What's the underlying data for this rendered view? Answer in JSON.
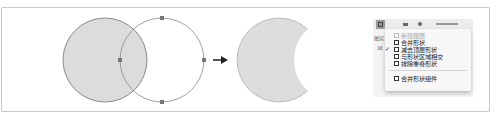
{
  "colors": {
    "shape_fill": "#dcdcdc",
    "shape_stroke": "#8a8a8a",
    "anchor": "#777777",
    "arrow": "#222222",
    "frame_border": "#c8c8c8"
  },
  "diagram": {
    "before": {
      "bottom_circle": {
        "cx": 105,
        "cy": 60,
        "r": 42,
        "filled": true
      },
      "top_circle": {
        "cx": 162,
        "cy": 60,
        "r": 42,
        "filled": false,
        "anchors": [
          [
            162,
            18
          ],
          [
            204,
            60
          ],
          [
            162,
            102
          ],
          [
            120,
            60
          ]
        ]
      }
    },
    "arrow_icon": "right-arrow",
    "after": {
      "result_shape": "crescent",
      "operation": "subtract-front-shape"
    }
  },
  "panel": {
    "side_labels": [
      "图层",
      "1€"
    ],
    "toolbar_selected_icon": "path-operations-icon"
  },
  "menu": {
    "items": [
      {
        "label": "新建图层",
        "checked": false,
        "disabled": true,
        "icon": "new-layer-icon"
      },
      {
        "label": "合并形状",
        "checked": false,
        "disabled": false,
        "icon": "combine-shapes-icon"
      },
      {
        "label": "减去顶层形状",
        "checked": true,
        "disabled": false,
        "icon": "subtract-front-shape-icon"
      },
      {
        "label": "与形状区域相交",
        "checked": false,
        "disabled": false,
        "icon": "intersect-shapes-icon"
      },
      {
        "label": "排除重叠形状",
        "checked": false,
        "disabled": false,
        "icon": "exclude-overlap-icon"
      },
      {
        "label": "合并形状组件",
        "checked": false,
        "disabled": false,
        "icon": "merge-shape-components-icon"
      }
    ],
    "check_glyph": "✓"
  }
}
